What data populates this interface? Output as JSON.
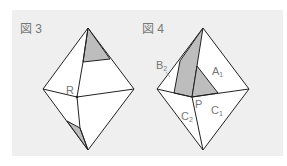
{
  "figures": [
    {
      "title": "図 3",
      "point_labels": [
        "R"
      ],
      "shaded_regions": 2
    },
    {
      "title": "図 4",
      "point_labels": [
        "B2",
        "A1",
        "P",
        "C2",
        "C1"
      ],
      "labels": {
        "B": "B",
        "B_sub": "2",
        "A": "A",
        "A_sub": "1",
        "P": "P",
        "C2": "C",
        "C2_sub": "2",
        "C1": "C",
        "C1_sub": "1"
      },
      "shaded_regions": 2
    }
  ],
  "colors": {
    "background": "#efefef",
    "face": "#ffffff",
    "shade": "#bdbdbd",
    "line": "#222222",
    "label": "#777777"
  }
}
